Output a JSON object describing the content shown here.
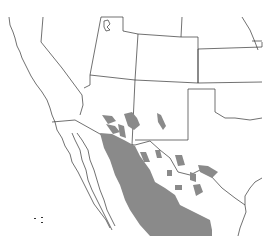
{
  "map": {
    "type": "species range map",
    "region": "Southwestern United States and northern Mexico",
    "colors": {
      "background": "#ffffff",
      "boundaries": "#333333",
      "range_fill": "#8a8a8a"
    },
    "labels": []
  }
}
